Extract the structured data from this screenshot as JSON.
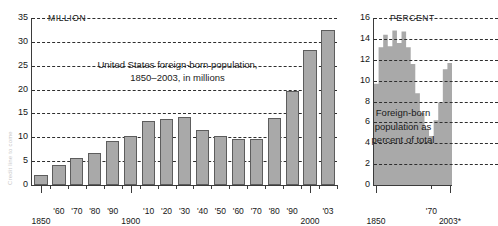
{
  "credit": {
    "text": "Credit line to come"
  },
  "chart_data": [
    {
      "id": "foreign-born-population",
      "type": "bar",
      "title": "United States foreign-born population,",
      "subtitle": "1850–2003, in millions",
      "unit_label": "MILLION",
      "xlabel": "",
      "ylabel": "",
      "ylim": [
        0,
        35
      ],
      "grid": true,
      "yticks": [
        0,
        5,
        10,
        15,
        20,
        25,
        30,
        35
      ],
      "ytick_labels": [
        "0",
        "5",
        "10",
        "15",
        "20",
        "25",
        "30",
        "35"
      ],
      "categories": [
        "1850",
        "'60",
        "'70",
        "'80",
        "'90",
        "1900",
        "'10",
        "'20",
        "'30",
        "'40",
        "'50",
        "'60",
        "'70",
        "'80",
        "'90",
        "2000",
        "'03"
      ],
      "major_ticks": [
        "1850",
        "1900",
        "2000"
      ],
      "values": [
        2.2,
        4.1,
        5.6,
        6.7,
        9.2,
        10.3,
        13.5,
        13.9,
        14.2,
        11.6,
        10.3,
        9.7,
        9.6,
        14.1,
        19.8,
        28.4,
        32.5
      ]
    },
    {
      "id": "foreign-born-percent",
      "type": "area",
      "title": "",
      "annotation": "Foreign-born population as percent of total",
      "annotation_lines": [
        "Foreign-born",
        "population as",
        "percent of total"
      ],
      "unit_label": "PERCENT",
      "ylim": [
        0,
        16
      ],
      "grid": true,
      "yticks": [
        0,
        2,
        4,
        6,
        8,
        10,
        12,
        14,
        16
      ],
      "ytick_labels": [
        "0",
        "2",
        "4",
        "6",
        "8",
        "10",
        "12",
        "14",
        "16"
      ],
      "xlabels": [
        "1850",
        "'70",
        "2003*"
      ],
      "x": [
        "1850",
        "1860",
        "1870",
        "1880",
        "1890",
        "1900",
        "1910",
        "1920",
        "1930",
        "1940",
        "1950",
        "1960",
        "1970",
        "1980",
        "1990",
        "2000",
        "2003"
      ],
      "values": [
        9.7,
        13.2,
        14.4,
        13.3,
        14.8,
        13.6,
        14.7,
        13.2,
        11.6,
        8.8,
        6.9,
        5.4,
        4.7,
        6.2,
        7.9,
        11.1,
        11.7
      ]
    }
  ]
}
